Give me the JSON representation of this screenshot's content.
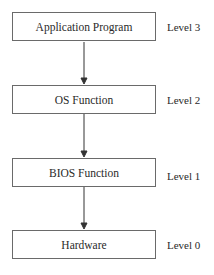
{
  "diagram": {
    "type": "layered-hierarchy",
    "layers": [
      {
        "label": "Application Program",
        "level": "Level 3"
      },
      {
        "label": "OS Function",
        "level": "Level 2"
      },
      {
        "label": "BIOS Function",
        "level": "Level 1"
      },
      {
        "label": "Hardware",
        "level": "Level 0"
      }
    ],
    "edges": [
      {
        "from": "Application Program",
        "to": "OS Function"
      },
      {
        "from": "OS Function",
        "to": "BIOS Function"
      },
      {
        "from": "BIOS Function",
        "to": "Hardware"
      }
    ],
    "colors": {
      "border": "#6a6a6a",
      "arrow": "#333333",
      "text": "#2a2a2a"
    }
  }
}
